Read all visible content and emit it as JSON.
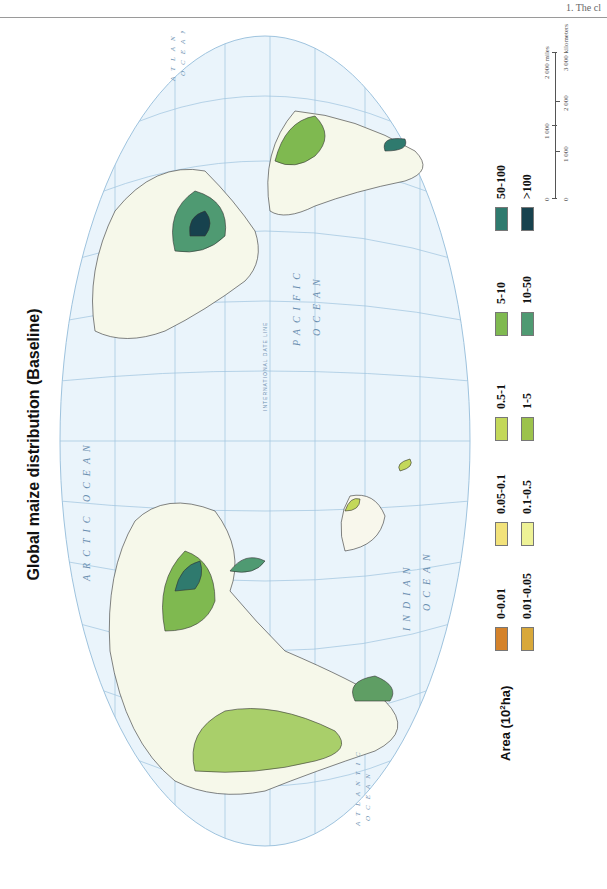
{
  "page": {
    "running_head": "1. The cl"
  },
  "title": "Global maize distribution (Baseline)",
  "map": {
    "projection": "oval world projection",
    "ocean_labels": {
      "arctic": "ARCTIC OCEAN",
      "pacific_1": "PACIFIC",
      "pacific_2": "OCEAN",
      "indian_1": "INDIAN",
      "indian_2": "OCEAN",
      "atlantic_1": "ATLANTIC",
      "atlantic_2": "OCEAN",
      "atlantic_n1": "ATLANTIC",
      "atlantic_n2": "OCEAN"
    },
    "line_labels": {
      "date_line": "INTERNATIONAL DATE LINE",
      "tropic_cancer": "Tropic of Cancer",
      "tropic_capricorn": "Tropic of Capricorn",
      "equator": "Equator"
    },
    "longitude_ticks": [
      "30°",
      "0°",
      "30°",
      "60°",
      "90°",
      "120°",
      "150°",
      "180°",
      "150°",
      "120°",
      "90°",
      "60°",
      "30°"
    ],
    "colors": {
      "ocean": "#eaf4fb",
      "graticule": "#9ec3de",
      "land": "#ffffff",
      "borders": "#222222"
    }
  },
  "legend": {
    "title_prefix": "Area (10",
    "title_sup": "2",
    "title_suffix": "ha)",
    "items": [
      {
        "label": "0-0.01",
        "color": "#d4822a"
      },
      {
        "label": "0.05-0.1",
        "color": "#f2e27a"
      },
      {
        "label": "0.5-1",
        "color": "#c3d85a"
      },
      {
        "label": "5-10",
        "color": "#7fb950"
      },
      {
        "label": "50-100",
        "color": "#2f7a6e"
      },
      {
        "label": "0.01-0.05",
        "color": "#d8a83a"
      },
      {
        "label": "0.1-0.5",
        "color": "#eef296"
      },
      {
        "label": "1-5",
        "color": "#9cc24c"
      },
      {
        "label": "10-50",
        "color": "#4f9a72"
      },
      {
        "label": ">100",
        "color": "#17424e"
      }
    ]
  },
  "scale_bar": {
    "miles_labels": [
      "0",
      "1 000",
      "2 000 miles"
    ],
    "km_labels": [
      "0",
      "1 000",
      "2 000",
      "3 000 kilometers"
    ]
  }
}
